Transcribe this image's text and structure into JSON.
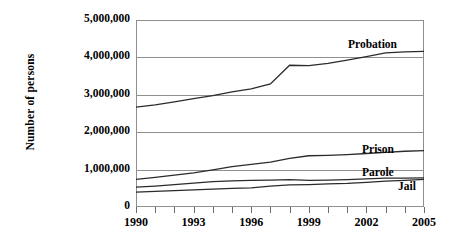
{
  "chart_data": {
    "type": "line",
    "title": "",
    "xlabel": "",
    "ylabel": "Number of persons",
    "xlim": [
      1990,
      2005
    ],
    "ylim": [
      0,
      5000000
    ],
    "grid": true,
    "legend_position": "inline-right",
    "x": [
      1990,
      1991,
      1992,
      1993,
      1994,
      1995,
      1996,
      1997,
      1998,
      1999,
      2000,
      2001,
      2002,
      2003,
      2004,
      2005
    ],
    "y_ticks": [
      0,
      1000000,
      2000000,
      3000000,
      4000000,
      5000000
    ],
    "y_tick_labels": [
      "0",
      "1,000,000",
      "2,000,000",
      "3,000,000",
      "4,000,000",
      "5,000,000"
    ],
    "x_ticks": [
      1990,
      1991,
      1992,
      1993,
      1994,
      1995,
      1996,
      1997,
      1998,
      1999,
      2000,
      2001,
      2002,
      2003,
      2004,
      2005
    ],
    "x_tick_labels": [
      {
        "value": 1990,
        "label": "1990"
      },
      {
        "value": 1993,
        "label": "1993"
      },
      {
        "value": 1996,
        "label": "1996"
      },
      {
        "value": 1999,
        "label": "1999"
      },
      {
        "value": 2002,
        "label": "2002"
      },
      {
        "value": 2005,
        "label": "2005"
      }
    ],
    "series": [
      {
        "name": "Probation",
        "label": "Probation",
        "color": "#2b2b2b",
        "values": [
          2670000,
          2730000,
          2810000,
          2900000,
          2980000,
          3080000,
          3160000,
          3290000,
          3790000,
          3780000,
          3840000,
          3930000,
          4020000,
          4120000,
          4150000,
          4160000
        ]
      },
      {
        "name": "Prison",
        "label": "Prison",
        "color": "#2b2b2b",
        "values": [
          740000,
          790000,
          850000,
          910000,
          990000,
          1080000,
          1140000,
          1200000,
          1300000,
          1370000,
          1380000,
          1400000,
          1430000,
          1460000,
          1490000,
          1510000
        ]
      },
      {
        "name": "Parole",
        "label": "Parole",
        "color": "#2b2b2b",
        "values": [
          530000,
          560000,
          600000,
          640000,
          680000,
          700000,
          710000,
          720000,
          730000,
          710000,
          720000,
          730000,
          750000,
          770000,
          770000,
          780000
        ]
      },
      {
        "name": "Jail",
        "label": "Jail",
        "color": "#2b2b2b",
        "values": [
          400000,
          420000,
          440000,
          460000,
          480000,
          500000,
          510000,
          560000,
          590000,
          600000,
          620000,
          630000,
          660000,
          690000,
          710000,
          740000
        ]
      }
    ]
  }
}
